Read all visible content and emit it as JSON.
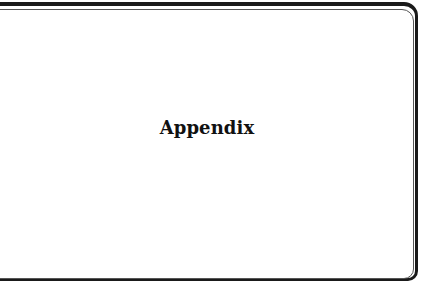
{
  "page": {
    "title": "Appendix"
  },
  "colors": {
    "frame_outer": "#1a1a1a",
    "frame_inner": "#555555",
    "text": "#111111",
    "background": "#ffffff"
  }
}
